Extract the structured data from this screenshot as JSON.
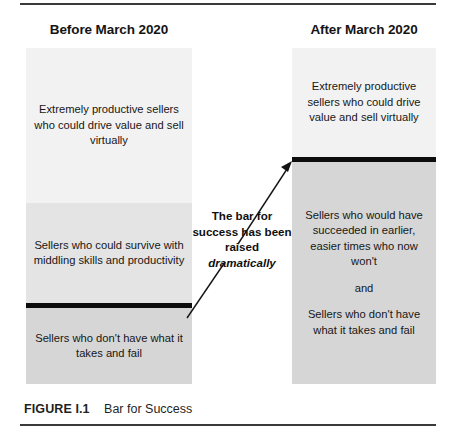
{
  "figure": {
    "caption_label": "FIGURE I.1",
    "caption_title": "Bar for Success",
    "rule_color": "#3a3a3a",
    "bar_color": "#0d0d0d"
  },
  "columns": {
    "before": {
      "heading": "Before March 2020",
      "bands": [
        {
          "id": "top",
          "text": "Extremely productive sellers who could drive value and sell virtually",
          "shade": "#f2f2f2"
        },
        {
          "id": "middle",
          "text": "Sellers who could survive with middling skills and productivity",
          "shade": "#e4e4e4"
        },
        {
          "id": "bottom",
          "text": "Sellers who don't have what it takes and fail",
          "shade": "#d6d6d6"
        }
      ],
      "bar_position": "above-bottom-band"
    },
    "after": {
      "heading": "After March 2020",
      "bands": [
        {
          "id": "top",
          "text": "Extremely productive sellers who could drive value and sell virtually",
          "shade": "#f2f2f2"
        },
        {
          "id": "bottom",
          "text_1": "Sellers who would have succeeded in earlier, easier times who now won't",
          "text_2": "and",
          "text_3": "Sellers who don't have what it takes and fail",
          "shade": "#d6d6d6"
        }
      ],
      "bar_position": "below-top-band"
    }
  },
  "callout": {
    "text": "The bar for success has been raised",
    "emphasis": "dramatically"
  },
  "arrow": {
    "name": "raised-bar-arrow",
    "from": "left-column-bar",
    "to": "right-column-bar"
  }
}
